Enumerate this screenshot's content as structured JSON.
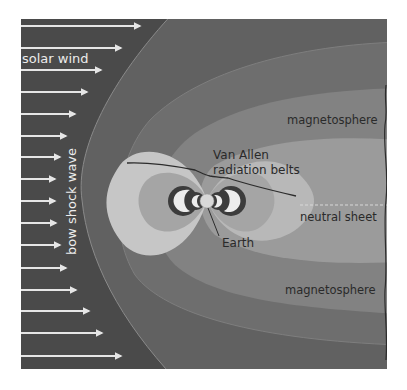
{
  "diagram": {
    "labels": {
      "solar_wind": "solar wind",
      "bow_shock": "bow shock wave",
      "van_allen_line1": "Van Allen",
      "van_allen_line2": "radiation belts",
      "magnetosphere_top": "magnetosphere",
      "neutral_sheet": "neutral sheet",
      "earth": "Earth",
      "magnetosphere_bottom": "magnetosphere"
    },
    "solar_wind_arrows": [
      {
        "y": 26,
        "x_end": 140
      },
      {
        "y": 48,
        "x_end": 121
      },
      {
        "y": 70,
        "x_end": 101
      },
      {
        "y": 92,
        "x_end": 87
      },
      {
        "y": 114,
        "x_end": 75
      },
      {
        "y": 136,
        "x_end": 66
      },
      {
        "y": 157,
        "x_end": 60
      },
      {
        "y": 179,
        "x_end": 55
      },
      {
        "y": 201,
        "x_end": 55
      },
      {
        "y": 223,
        "x_end": 56
      },
      {
        "y": 245,
        "x_end": 60
      },
      {
        "y": 268,
        "x_end": 66
      },
      {
        "y": 290,
        "x_end": 76
      },
      {
        "y": 311,
        "x_end": 89
      },
      {
        "y": 333,
        "x_end": 102
      },
      {
        "y": 356,
        "x_end": 121
      }
    ],
    "colors": {
      "solar_wind_region": "#4a4a4a",
      "bow_shock_region": "#616161",
      "outer_magnetosphere": "#7b7b7b",
      "magnetosphere_band": "#8e8e8e",
      "inner_tail": "#a3a3a3",
      "dayside_lobe": "#c6c6c6",
      "inner_lobe": "#a8a8a8",
      "belt_ring": "#3c3c3c",
      "belt_core": "#ececec",
      "earth": "#d8d8d8",
      "arrow": "#e6e6e6",
      "outline": "#2c2c2c"
    }
  }
}
